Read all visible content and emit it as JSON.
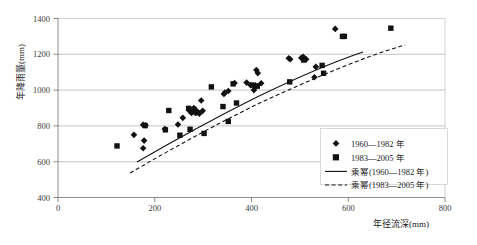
{
  "chart_data": {
    "type": "scatter",
    "title": "",
    "xlabel": "年径流深(mm)",
    "ylabel": "年降雨量(mm)",
    "xlim": [
      0,
      800
    ],
    "ylim": [
      400,
      1400
    ],
    "xticks": [
      0,
      200,
      400,
      600,
      800
    ],
    "yticks": [
      400,
      600,
      800,
      1000,
      1200,
      1400
    ],
    "xtick_labels": [
      "0",
      "200",
      "400",
      "600",
      "800"
    ],
    "ytick_labels": [
      "400",
      "600",
      "800",
      "1000",
      "1200",
      "1400"
    ],
    "grid": "horizontal",
    "legend_position": "bottom-right",
    "series": [
      {
        "name": "1960—1982 年",
        "marker": "diamond",
        "color": "#111111",
        "points": [
          [
            157,
            750
          ],
          [
            176,
            675
          ],
          [
            178,
            718
          ],
          [
            176,
            806
          ],
          [
            181,
            803
          ],
          [
            221,
            782
          ],
          [
            248,
            808
          ],
          [
            258,
            845
          ],
          [
            272,
            884
          ],
          [
            276,
            872
          ],
          [
            281,
            900
          ],
          [
            285,
            872
          ],
          [
            288,
            880
          ],
          [
            292,
            868
          ],
          [
            296,
            942
          ],
          [
            299,
            884
          ],
          [
            343,
            978
          ],
          [
            345,
            986
          ],
          [
            352,
            995
          ],
          [
            365,
            1040
          ],
          [
            390,
            1042
          ],
          [
            398,
            1028
          ],
          [
            405,
            1000
          ],
          [
            410,
            1112
          ],
          [
            413,
            1095
          ],
          [
            420,
            1038
          ],
          [
            477,
            1178
          ],
          [
            480,
            1172
          ],
          [
            503,
            1180
          ],
          [
            507,
            1186
          ],
          [
            513,
            1172
          ],
          [
            530,
            1072
          ],
          [
            533,
            1130
          ],
          [
            573,
            1342
          ]
        ]
      },
      {
        "name": "1983—2005 年",
        "marker": "square",
        "color": "#111111",
        "points": [
          [
            122,
            688
          ],
          [
            180,
            802
          ],
          [
            222,
            778
          ],
          [
            229,
            886
          ],
          [
            252,
            748
          ],
          [
            270,
            898
          ],
          [
            273,
            781
          ],
          [
            281,
            892
          ],
          [
            286,
            875
          ],
          [
            302,
            758
          ],
          [
            317,
            1018
          ],
          [
            341,
            908
          ],
          [
            352,
            825
          ],
          [
            362,
            1035
          ],
          [
            369,
            928
          ],
          [
            404,
            1028
          ],
          [
            408,
            1022
          ],
          [
            412,
            1022
          ],
          [
            479,
            1046
          ],
          [
            508,
            1168
          ],
          [
            546,
            1138
          ],
          [
            549,
            1094
          ],
          [
            588,
            1300
          ],
          [
            592,
            1300
          ],
          [
            688,
            1346
          ]
        ]
      }
    ],
    "trendlines": [
      {
        "name": "乘幂(1960—1982 年)",
        "style": "solid"
      },
      {
        "name": "乘幂(1983—2005 年)",
        "style": "dashed"
      }
    ]
  },
  "legend": {
    "items": [
      {
        "label": "1960—1982 年",
        "marker": "diamond"
      },
      {
        "label": "1983—2005 年",
        "marker": "square"
      },
      {
        "label": "乘幂(1960—1982 年)",
        "marker": "solid-line"
      },
      {
        "label": "乘幂(1983—2005 年)",
        "marker": "dashed-line"
      }
    ]
  },
  "axes": {
    "x_title": "年径流深(mm)",
    "y_title": "年降雨量(mm)",
    "x_labels": [
      "0",
      "200",
      "400",
      "600",
      "800"
    ],
    "y_labels": [
      "400",
      "600",
      "800",
      "1000",
      "1200",
      "1400"
    ]
  }
}
